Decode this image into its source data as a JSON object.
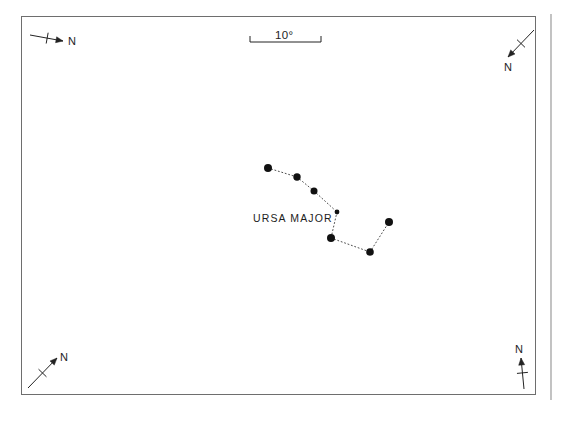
{
  "figure": {
    "kind": "star-chart",
    "background_color": "#ffffff",
    "border_color": "#6e6e6e",
    "ink_color": "#232323",
    "star_color": "#111111",
    "frame": {
      "x": 21,
      "y": 16,
      "width": 515,
      "height": 379
    },
    "right_rule": {
      "x": 551,
      "y_top": 14,
      "y_bottom": 400,
      "color": "#9a9a9a"
    }
  },
  "scale_bar": {
    "label": "10 °",
    "label_text": "10°",
    "x_start": 250,
    "x_end": 321,
    "y_line": 42,
    "tick_height": 6,
    "label_x": 275,
    "label_y": 30
  },
  "compass_roses": [
    {
      "name": "compass-top-left",
      "label": "N",
      "tail_x": 30,
      "tail_y": 35,
      "tip_x": 63,
      "tip_y": 41,
      "label_x": 68,
      "label_y": 36,
      "tick_center_t": 0.52
    },
    {
      "name": "compass-top-right",
      "label": "N",
      "tail_x": 534,
      "tail_y": 30,
      "tip_x": 508,
      "tip_y": 57,
      "label_x": 504,
      "label_y": 62,
      "tick_center_t": 0.5
    },
    {
      "name": "compass-bottom-left",
      "label": "N",
      "tail_x": 28,
      "tail_y": 388,
      "tip_x": 57,
      "tip_y": 358,
      "label_x": 60,
      "label_y": 352,
      "tick_center_t": 0.5
    },
    {
      "name": "compass-bottom-right",
      "label": "N",
      "tail_x": 524,
      "tail_y": 389,
      "tip_x": 521,
      "tip_y": 358,
      "label_x": 515,
      "label_y": 344,
      "tick_center_t": 0.52
    }
  ],
  "chart_data": {
    "type": "scatter",
    "title": "",
    "xlabel": "",
    "ylabel": "",
    "grid": false,
    "legend": null,
    "annotations": [
      {
        "text": "URSA MAJOR",
        "x": 253,
        "y": 213
      },
      {
        "text": "10°",
        "x": 275,
        "y": 30
      }
    ],
    "constellation": "URSA MAJOR",
    "constellation_label": "URSA MAJOR",
    "star_label_x": 253,
    "star_label_y": 213,
    "xlim": [
      21,
      536
    ],
    "ylim": [
      16,
      395
    ],
    "stars": [
      {
        "id": "s1",
        "name": "Dubhe",
        "x": 268,
        "y": 168,
        "r": 4.0
      },
      {
        "id": "s2",
        "name": "Merak",
        "x": 297,
        "y": 177,
        "r": 3.7
      },
      {
        "id": "s3",
        "name": "Phecda",
        "x": 314,
        "y": 191,
        "r": 3.5
      },
      {
        "id": "s4",
        "name": "Megrez",
        "x": 337,
        "y": 212,
        "r": 2.4
      },
      {
        "id": "s5",
        "name": "Alioth",
        "x": 331,
        "y": 238,
        "r": 4.0
      },
      {
        "id": "s6",
        "name": "Mizar",
        "x": 370,
        "y": 252,
        "r": 3.8
      },
      {
        "id": "s7",
        "name": "Alkaid",
        "x": 389,
        "y": 222,
        "r": 4.0
      }
    ],
    "links": [
      [
        "s1",
        "s2"
      ],
      [
        "s2",
        "s3"
      ],
      [
        "s3",
        "s4"
      ],
      [
        "s4",
        "s5"
      ],
      [
        "s5",
        "s6"
      ],
      [
        "s6",
        "s7"
      ]
    ]
  }
}
